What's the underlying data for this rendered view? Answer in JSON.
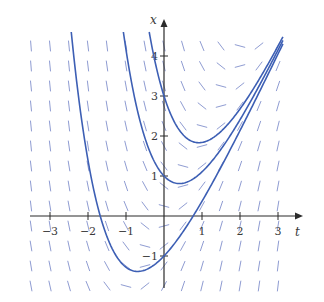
{
  "chart_data": {
    "type": "line",
    "title": "",
    "subtitle": "Direction (slope) field for x' = 2t - x with three solution curves",
    "xlabel": "t",
    "ylabel": "x",
    "xlim": [
      -3.5,
      3.6
    ],
    "ylim": [
      -1.8,
      4.9
    ],
    "grid": false,
    "legend": "none",
    "x_ticks": [
      -3,
      -2,
      -1,
      1,
      2,
      3
    ],
    "x_tick_labels": [
      "-3",
      "-2",
      "-1",
      "1",
      "2",
      "3"
    ],
    "y_ticks": [
      -1,
      1,
      2,
      3,
      4
    ],
    "y_tick_labels": [
      "-1",
      "1",
      "2",
      "3",
      "4"
    ],
    "slope_field": {
      "equation": "x' = 2t - x",
      "t_range": [
        -3.5,
        3.0
      ],
      "t_step": 0.5,
      "x_range": [
        -1.75,
        4.5
      ],
      "x_step": 0.5,
      "segment_length_px": 10,
      "color": "#8f9cd2"
    },
    "series": [
      {
        "name": "x(0)=3",
        "formula": "x = 2t - 2 + 5e^{-t}",
        "C": 5,
        "x0": 3,
        "t": [
          -0.33,
          0,
          0.5,
          0.92,
          1.5,
          2,
          2.5,
          3,
          3.1
        ],
        "values": [
          4.6,
          3.0,
          2.03,
          1.83,
          2.12,
          2.68,
          3.41,
          4.25,
          4.42
        ]
      },
      {
        "name": "x(0)=1",
        "formula": "x = 2t - 2 + 3e^{-t}",
        "C": 3,
        "x0": 1,
        "t": [
          -1.17,
          -1,
          -0.5,
          0,
          0.41,
          1,
          1.5,
          2,
          2.5,
          3,
          3.13
        ],
        "values": [
          4.6,
          4.15,
          1.95,
          1.0,
          0.81,
          1.1,
          1.67,
          2.41,
          3.25,
          4.15,
          4.39
        ]
      },
      {
        "name": "x(0)=-1",
        "formula": "x = 2t - 2 + e^{-t}",
        "C": 1,
        "x0": -1,
        "t": [
          -2.4,
          -2,
          -1.5,
          -1,
          -0.69,
          0,
          0.5,
          1,
          1.5,
          2,
          2.5,
          3,
          3.15
        ],
        "values": [
          4.22,
          1.39,
          -0.52,
          -1.28,
          -1.39,
          -1.0,
          -0.39,
          0.37,
          1.22,
          2.14,
          3.08,
          4.05,
          4.34
        ]
      }
    ],
    "colors": {
      "curve": "#3d5fb4",
      "slope": "#8f9cd2",
      "axis": "#2b2b2b"
    },
    "mapping": {
      "origin_px": [
        164,
        216
      ],
      "px_per_t": 38,
      "px_per_x": 40
    }
  }
}
